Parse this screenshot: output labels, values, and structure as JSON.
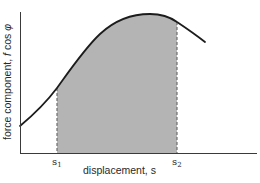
{
  "diagram": {
    "type": "work-integral-area-under-curve",
    "y_axis_label": {
      "prefix": "force component, ",
      "f": "f",
      "cos": " cos ",
      "phi": "φ"
    },
    "x_axis_label": "displacement, s",
    "markers": [
      {
        "symbol": "s",
        "subscript": "1"
      },
      {
        "symbol": "s",
        "subscript": "2"
      }
    ],
    "colors": {
      "curve": "#1c1c1c",
      "axes": "#3a3a3a",
      "shaded_area": "#b4b4b4",
      "dashed_lines": "#6e6e6e",
      "text": "#2a2a2a"
    }
  }
}
